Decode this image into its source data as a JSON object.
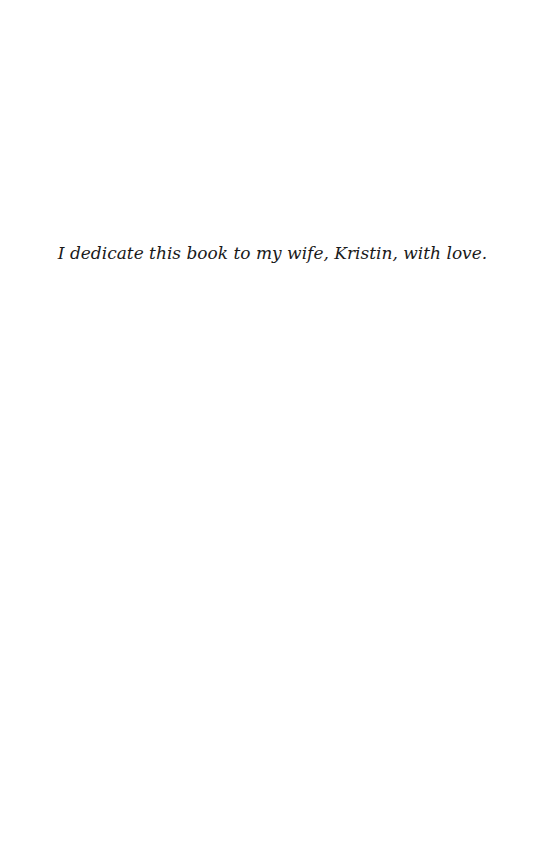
{
  "page": {
    "dedication": "I dedicate this book to my wife, Kristin, with love."
  }
}
